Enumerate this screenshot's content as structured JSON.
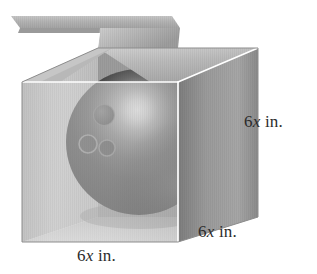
{
  "figure": {
    "shapes": {
      "box": {
        "name": "open cardboard cube box",
        "face_front_color": "#d2d2d2",
        "face_right_color": "#8f8f8f",
        "face_top_color": "#bdbdbd",
        "face_inner_left_color": "#c4c4c4",
        "edge_highlight_color": "#ffffff",
        "lid_flap_color": "#b4b4b4"
      },
      "ball": {
        "name": "bowling ball",
        "base_color": "#1b1b1b",
        "highlight_color": "#f2f2f2",
        "finger_holes": 3,
        "hole_color": "#3a3a3a"
      }
    }
  },
  "labels": {
    "right": {
      "number": "6",
      "variable": "x",
      "unit": "in."
    },
    "bottom_right": {
      "number": "6",
      "variable": "x",
      "unit": "in."
    },
    "bottom": {
      "number": "6",
      "variable": "x",
      "unit": "in."
    }
  },
  "colors": {
    "background": "#ffffff",
    "text": "#2b2b2b",
    "accent_edge": "#ffffff"
  }
}
